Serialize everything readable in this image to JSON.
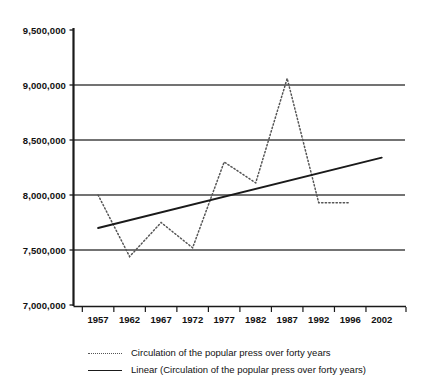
{
  "chart_data": {
    "type": "line",
    "title": "",
    "xlabel": "",
    "ylabel": "",
    "grid": true,
    "legend_position": "bottom",
    "xlim": [
      1957,
      2002
    ],
    "ylim": [
      7000000,
      9500000
    ],
    "y_ticks": [
      "7,000,000",
      "7,500,000",
      "8,000,000",
      "8,500,000",
      "9,000,000",
      "9,500,000"
    ],
    "y_tick_values": [
      7000000,
      7500000,
      8000000,
      8500000,
      9000000,
      9500000
    ],
    "x_ticks": [
      "1957",
      "1962",
      "1967",
      "1972",
      "1977",
      "1982",
      "1987",
      "1992",
      "1996",
      "2002"
    ],
    "x_tick_values": [
      1957,
      1962,
      1967,
      1972,
      1977,
      1982,
      1987,
      1992,
      1996,
      2002
    ],
    "categories": [
      1957,
      1962,
      1967,
      1972,
      1977,
      1982,
      1987,
      1992,
      1996
    ],
    "series": [
      {
        "name": "Circulation of the popular press over forty years",
        "style": "dotted",
        "color": "#555555",
        "x": [
          1957,
          1962,
          1967,
          1972,
          1977,
          1982,
          1987,
          1992,
          1996
        ],
        "values": [
          8000000,
          7440000,
          7750000,
          7520000,
          8300000,
          8110000,
          9060000,
          7930000,
          7930000
        ]
      },
      {
        "name": "Linear (Circulation of the popular press over forty years)",
        "style": "solid",
        "color": "#1a1a1a",
        "x": [
          1957,
          2002
        ],
        "values": [
          7700000,
          8340000
        ]
      }
    ]
  },
  "legend": {
    "entries": [
      {
        "label": "Circulation of the popular press over forty years",
        "marker": "dotted-line-swatch"
      },
      {
        "label": "Linear (Circulation of the popular press over forty years)",
        "marker": "solid-line-swatch"
      }
    ]
  },
  "colors": {
    "axis": "#1a1a1a",
    "gridline": "#444444",
    "series_dotted": "#555555",
    "series_solid": "#1a1a1a",
    "background": "#ffffff"
  }
}
